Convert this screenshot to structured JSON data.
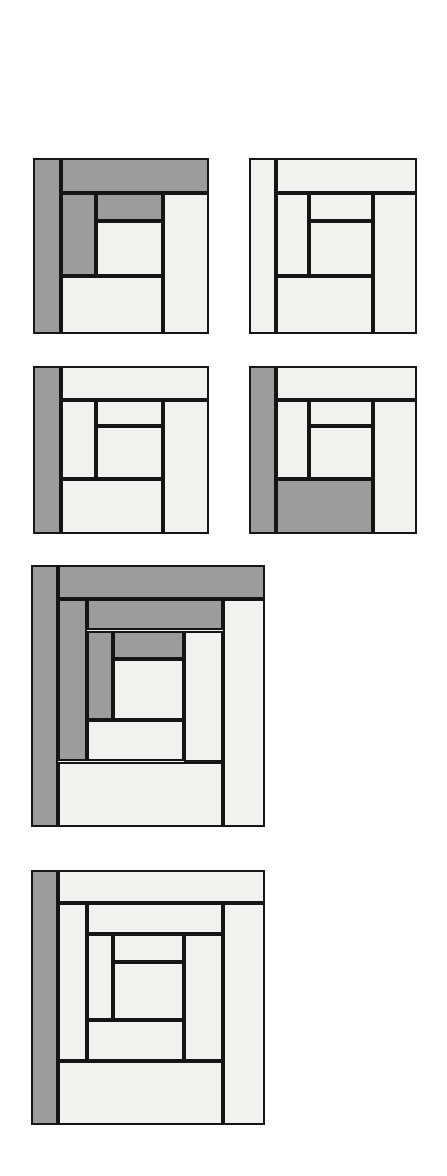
{
  "page": {
    "background_color": "#ffffff",
    "width": 447,
    "height": 1176
  },
  "palette": {
    "light_fabric": "#f1f1ef",
    "dark_fabric": "#9c9c9c",
    "outline": "#151515",
    "page_background": "#ffffff"
  },
  "legend": {
    "light_label": "light fabric",
    "dark_label": "dark fabric"
  },
  "blocks": [
    {
      "id": "block-1",
      "name": "log-cabin-block-1",
      "label": "Block 1",
      "x": 33,
      "y": 158,
      "w": 176,
      "h": 176,
      "dark_piece_count": 4,
      "light_piece_count": 4,
      "pieces": [
        {
          "name": "left-log",
          "x": 0,
          "y": 0,
          "w": 16,
          "h": 100,
          "fabric": "dark"
        },
        {
          "name": "top-log",
          "x": 16,
          "y": 0,
          "w": 84,
          "h": 20,
          "fabric": "dark"
        },
        {
          "name": "right-log",
          "x": 74,
          "y": 20,
          "w": 26,
          "h": 80,
          "fabric": "light"
        },
        {
          "name": "bottom-log",
          "x": 16,
          "y": 67,
          "w": 58,
          "h": 33,
          "fabric": "light"
        },
        {
          "name": "inner-left-log",
          "x": 16,
          "y": 20,
          "w": 20,
          "h": 47,
          "fabric": "dark"
        },
        {
          "name": "inner-top-log",
          "x": 36,
          "y": 20,
          "w": 38,
          "h": 16,
          "fabric": "dark"
        },
        {
          "name": "inner-center-log",
          "x": 36,
          "y": 36,
          "w": 38,
          "h": 31,
          "fabric": "light"
        }
      ]
    },
    {
      "id": "block-2",
      "name": "log-cabin-block-2",
      "label": "Block 2",
      "x": 249,
      "y": 158,
      "w": 168,
      "h": 176,
      "dark_piece_count": 0,
      "light_piece_count": 7,
      "pieces": [
        {
          "name": "left-log",
          "x": 0,
          "y": 0,
          "w": 16,
          "h": 100,
          "fabric": "light"
        },
        {
          "name": "top-log",
          "x": 16,
          "y": 0,
          "w": 84,
          "h": 20,
          "fabric": "light"
        },
        {
          "name": "right-log",
          "x": 74,
          "y": 20,
          "w": 26,
          "h": 80,
          "fabric": "light"
        },
        {
          "name": "bottom-log",
          "x": 16,
          "y": 67,
          "w": 58,
          "h": 33,
          "fabric": "light"
        },
        {
          "name": "inner-left-log",
          "x": 16,
          "y": 20,
          "w": 20,
          "h": 47,
          "fabric": "light"
        },
        {
          "name": "inner-top-log",
          "x": 36,
          "y": 20,
          "w": 38,
          "h": 16,
          "fabric": "light"
        },
        {
          "name": "inner-center-log",
          "x": 36,
          "y": 36,
          "w": 38,
          "h": 31,
          "fabric": "light"
        }
      ]
    },
    {
      "id": "block-3",
      "name": "log-cabin-block-3",
      "label": "Block 3",
      "x": 33,
      "y": 366,
      "w": 176,
      "h": 168,
      "dark_piece_count": 1,
      "light_piece_count": 6,
      "pieces": [
        {
          "name": "left-log",
          "x": 0,
          "y": 0,
          "w": 16,
          "h": 100,
          "fabric": "dark"
        },
        {
          "name": "top-log",
          "x": 16,
          "y": 0,
          "w": 84,
          "h": 20,
          "fabric": "light"
        },
        {
          "name": "right-log",
          "x": 74,
          "y": 20,
          "w": 26,
          "h": 80,
          "fabric": "light"
        },
        {
          "name": "bottom-log",
          "x": 16,
          "y": 67,
          "w": 58,
          "h": 33,
          "fabric": "light"
        },
        {
          "name": "inner-left-log",
          "x": 16,
          "y": 20,
          "w": 20,
          "h": 47,
          "fabric": "light"
        },
        {
          "name": "inner-top-log",
          "x": 36,
          "y": 20,
          "w": 38,
          "h": 16,
          "fabric": "light"
        },
        {
          "name": "inner-center-log",
          "x": 36,
          "y": 36,
          "w": 38,
          "h": 31,
          "fabric": "light"
        }
      ]
    },
    {
      "id": "block-4",
      "name": "log-cabin-block-4",
      "label": "Block 4",
      "x": 249,
      "y": 366,
      "w": 168,
      "h": 168,
      "dark_piece_count": 2,
      "light_piece_count": 5,
      "pieces": [
        {
          "name": "left-log",
          "x": 0,
          "y": 0,
          "w": 16,
          "h": 100,
          "fabric": "dark"
        },
        {
          "name": "top-log",
          "x": 16,
          "y": 0,
          "w": 84,
          "h": 20,
          "fabric": "light"
        },
        {
          "name": "right-log",
          "x": 74,
          "y": 20,
          "w": 26,
          "h": 80,
          "fabric": "light"
        },
        {
          "name": "bottom-log",
          "x": 16,
          "y": 67,
          "w": 58,
          "h": 33,
          "fabric": "dark"
        },
        {
          "name": "inner-left-log",
          "x": 16,
          "y": 20,
          "w": 20,
          "h": 47,
          "fabric": "light"
        },
        {
          "name": "inner-top-log",
          "x": 36,
          "y": 20,
          "w": 38,
          "h": 16,
          "fabric": "light"
        },
        {
          "name": "inner-center-log",
          "x": 36,
          "y": 36,
          "w": 38,
          "h": 31,
          "fabric": "light"
        }
      ]
    },
    {
      "id": "block-5",
      "name": "log-cabin-block-5",
      "label": "Block 5",
      "x": 31,
      "y": 565,
      "w": 234,
      "h": 262,
      "dark_piece_count": 6,
      "light_piece_count": 6,
      "pieces": [
        {
          "name": "round1-left-log",
          "x": 0,
          "y": 0,
          "w": 11.5,
          "h": 100,
          "fabric": "dark"
        },
        {
          "name": "round1-top-log",
          "x": 11.5,
          "y": 0,
          "w": 88.5,
          "h": 13,
          "fabric": "dark"
        },
        {
          "name": "round1-right-log",
          "x": 82,
          "y": 13,
          "w": 18,
          "h": 87,
          "fabric": "light"
        },
        {
          "name": "round1-bottom-log",
          "x": 11.5,
          "y": 75,
          "w": 70.5,
          "h": 25,
          "fabric": "light"
        },
        {
          "name": "round2-left-log",
          "x": 11.5,
          "y": 13,
          "w": 12.5,
          "h": 62,
          "fabric": "dark"
        },
        {
          "name": "round2-top-log",
          "x": 24,
          "y": 13,
          "w": 58,
          "h": 12,
          "fabric": "dark"
        },
        {
          "name": "round2-right-log",
          "x": 65.5,
          "y": 25,
          "w": 16.5,
          "h": 50,
          "fabric": "light"
        },
        {
          "name": "round2-bottom-log",
          "x": 24,
          "y": 59,
          "w": 41.5,
          "h": 16,
          "fabric": "light"
        },
        {
          "name": "round3-left-log",
          "x": 24,
          "y": 25,
          "w": 11,
          "h": 34,
          "fabric": "dark"
        },
        {
          "name": "round3-top-log",
          "x": 35,
          "y": 25,
          "w": 30.5,
          "h": 11,
          "fabric": "dark"
        },
        {
          "name": "round3-center-log",
          "x": 35,
          "y": 36,
          "w": 30.5,
          "h": 23,
          "fabric": "light"
        }
      ]
    },
    {
      "id": "block-6",
      "name": "log-cabin-block-6",
      "label": "Block 6",
      "x": 31,
      "y": 870,
      "w": 234,
      "h": 255,
      "dark_piece_count": 1,
      "light_piece_count": 11,
      "pieces": [
        {
          "name": "round1-left-log",
          "x": 0,
          "y": 0,
          "w": 11.5,
          "h": 100,
          "fabric": "dark"
        },
        {
          "name": "round1-top-log",
          "x": 11.5,
          "y": 0,
          "w": 88.5,
          "h": 13,
          "fabric": "light"
        },
        {
          "name": "round1-right-log",
          "x": 82,
          "y": 13,
          "w": 18,
          "h": 87,
          "fabric": "light"
        },
        {
          "name": "round1-bottom-log",
          "x": 11.5,
          "y": 75,
          "w": 70.5,
          "h": 25,
          "fabric": "light"
        },
        {
          "name": "round2-left-log",
          "x": 11.5,
          "y": 13,
          "w": 12.5,
          "h": 62,
          "fabric": "light"
        },
        {
          "name": "round2-top-log",
          "x": 24,
          "y": 13,
          "w": 58,
          "h": 12,
          "fabric": "light"
        },
        {
          "name": "round2-right-log",
          "x": 65.5,
          "y": 25,
          "w": 16.5,
          "h": 50,
          "fabric": "light"
        },
        {
          "name": "round2-bottom-log",
          "x": 24,
          "y": 59,
          "w": 41.5,
          "h": 16,
          "fabric": "light"
        },
        {
          "name": "round3-left-log",
          "x": 24,
          "y": 25,
          "w": 11,
          "h": 34,
          "fabric": "light"
        },
        {
          "name": "round3-top-log",
          "x": 35,
          "y": 25,
          "w": 30.5,
          "h": 11,
          "fabric": "light"
        },
        {
          "name": "round3-center-log",
          "x": 35,
          "y": 36,
          "w": 30.5,
          "h": 23,
          "fabric": "light"
        }
      ]
    }
  ]
}
